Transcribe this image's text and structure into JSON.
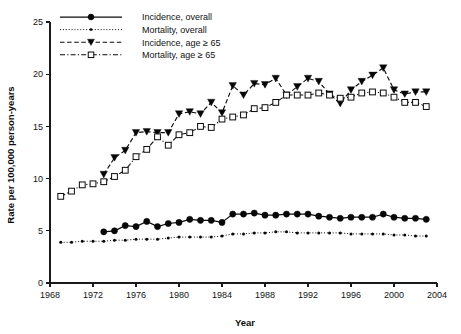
{
  "chart_data": {
    "type": "line",
    "title": "",
    "xlabel": "Year",
    "ylabel": "Rate per 100,000 person-years",
    "xlim": [
      1968,
      2004
    ],
    "ylim": [
      0,
      25
    ],
    "xticks": [
      1968,
      1972,
      1976,
      1980,
      1984,
      1988,
      1992,
      1996,
      2000,
      2004
    ],
    "yticks": [
      0,
      5,
      10,
      15,
      20,
      25
    ],
    "grid": false,
    "legend_position": "top-left",
    "series": [
      {
        "name": "Incidence, overall",
        "marker": "filled-circle",
        "linestyle": "solid",
        "x": [
          1973,
          1974,
          1975,
          1976,
          1977,
          1978,
          1979,
          1980,
          1981,
          1982,
          1983,
          1984,
          1985,
          1986,
          1987,
          1988,
          1989,
          1990,
          1991,
          1992,
          1993,
          1994,
          1995,
          1996,
          1997,
          1998,
          1999,
          2000,
          2001,
          2002,
          2003
        ],
        "values": [
          4.9,
          5.0,
          5.5,
          5.4,
          5.9,
          5.4,
          5.7,
          5.8,
          6.1,
          6.0,
          6.0,
          5.8,
          6.6,
          6.6,
          6.7,
          6.5,
          6.5,
          6.6,
          6.6,
          6.6,
          6.4,
          6.3,
          6.2,
          6.3,
          6.3,
          6.3,
          6.6,
          6.3,
          6.2,
          6.2,
          6.1
        ]
      },
      {
        "name": "Mortality, overall",
        "marker": "small-dot",
        "linestyle": "dotted",
        "x": [
          1969,
          1970,
          1971,
          1972,
          1973,
          1974,
          1975,
          1976,
          1977,
          1978,
          1979,
          1980,
          1981,
          1982,
          1983,
          1984,
          1985,
          1986,
          1987,
          1988,
          1989,
          1990,
          1991,
          1992,
          1993,
          1994,
          1995,
          1996,
          1997,
          1998,
          1999,
          2000,
          2001,
          2002,
          2003
        ],
        "values": [
          3.9,
          3.9,
          4.0,
          4.0,
          4.0,
          4.1,
          4.1,
          4.2,
          4.2,
          4.2,
          4.3,
          4.4,
          4.4,
          4.4,
          4.4,
          4.5,
          4.7,
          4.7,
          4.8,
          4.8,
          4.9,
          4.9,
          4.8,
          4.8,
          4.8,
          4.8,
          4.8,
          4.7,
          4.7,
          4.7,
          4.7,
          4.6,
          4.6,
          4.5,
          4.5
        ]
      },
      {
        "name": "Incidence, age ≥ 65",
        "marker": "filled-triangle-down",
        "linestyle": "dashed",
        "x": [
          1973,
          1974,
          1975,
          1976,
          1977,
          1978,
          1979,
          1980,
          1981,
          1982,
          1983,
          1984,
          1985,
          1986,
          1987,
          1988,
          1989,
          1990,
          1991,
          1992,
          1993,
          1994,
          1995,
          1996,
          1997,
          1998,
          1999,
          2000,
          2001,
          2002,
          2003
        ],
        "values": [
          10.4,
          12.0,
          12.7,
          14.4,
          14.5,
          14.4,
          14.4,
          16.2,
          16.4,
          16.2,
          17.3,
          16.3,
          18.9,
          18.0,
          19.1,
          19.0,
          19.6,
          18.0,
          18.8,
          19.6,
          19.3,
          18.1,
          17.2,
          18.5,
          19.3,
          19.9,
          20.6,
          18.5,
          18.1,
          18.3,
          18.3
        ]
      },
      {
        "name": "Mortality, age ≥ 65",
        "marker": "open-square",
        "linestyle": "dash-dot",
        "x": [
          1969,
          1970,
          1971,
          1972,
          1973,
          1974,
          1975,
          1976,
          1977,
          1978,
          1979,
          1980,
          1981,
          1982,
          1983,
          1984,
          1985,
          1986,
          1987,
          1988,
          1989,
          1990,
          1991,
          1992,
          1993,
          1994,
          1995,
          1996,
          1997,
          1998,
          1999,
          2000,
          2001,
          2002,
          2003
        ],
        "values": [
          8.3,
          8.8,
          9.4,
          9.5,
          9.7,
          10.2,
          10.8,
          12.1,
          12.8,
          14.0,
          13.2,
          14.2,
          14.4,
          15.0,
          14.9,
          15.7,
          15.9,
          16.1,
          16.7,
          16.8,
          17.3,
          18.0,
          18.0,
          18.0,
          18.2,
          18.0,
          17.7,
          17.8,
          18.2,
          18.3,
          18.2,
          17.8,
          17.3,
          17.3,
          16.9
        ]
      }
    ]
  },
  "legend": {
    "items": [
      {
        "label": "Incidence, overall"
      },
      {
        "label": "Mortality, overall"
      },
      {
        "label": "Incidence, age ≥ 65"
      },
      {
        "label": "Mortality, age ≥ 65"
      }
    ]
  },
  "axes": {
    "x_title": "Year",
    "y_title": "Rate per 100,000 person-years"
  },
  "colors": {
    "ink": "#0a0a0a",
    "background": "#ffffff",
    "marker_fill": "#ffffff"
  }
}
